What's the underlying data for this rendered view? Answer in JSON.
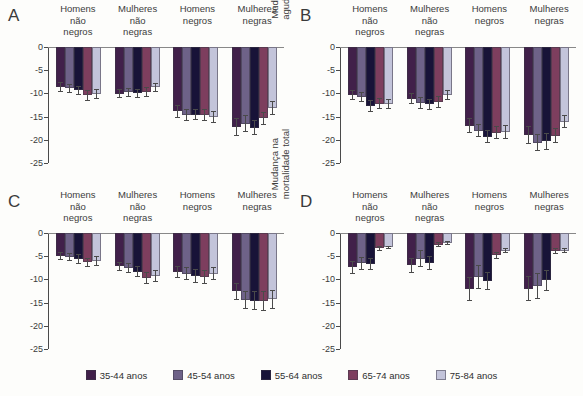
{
  "figure": {
    "background": "#fdfdfb",
    "groups": [
      {
        "lines": [
          "Homens",
          "não",
          "negros"
        ]
      },
      {
        "lines": [
          "Mulheres",
          "não",
          "negras"
        ]
      },
      {
        "lines": [
          "Homens",
          "negros"
        ]
      },
      {
        "lines": [
          "Mulheres",
          "negras"
        ]
      }
    ],
    "y_ticks": [
      "0",
      "-5",
      "-10",
      "-15",
      "-20",
      "-25"
    ]
  },
  "legend": {
    "position": "bottom-center",
    "items": [
      {
        "label": "35-44 anos",
        "color": "#41204a"
      },
      {
        "label": "45-54 anos",
        "color": "#6e6288"
      },
      {
        "label": "55-64 anos",
        "color": "#181338"
      },
      {
        "label": "65-74 anos",
        "color": "#7d3e5e"
      },
      {
        "label": "75-84 anos",
        "color": "#c3c4da"
      }
    ]
  },
  "chart_data": [
    {
      "panel": "A",
      "type": "bar",
      "title": "",
      "ylabel": "Mudança na incidência de\ndoença coronariana",
      "xlabel": "",
      "ylim": [
        -25,
        0
      ],
      "grid": false,
      "categories": [
        "Homens não negros",
        "Mulheres não negras",
        "Homens negros",
        "Mulheres negras"
      ],
      "series": [
        {
          "name": "35-44 anos",
          "color": "#41204a",
          "values": [
            -8.6,
            -10.1,
            -13.9,
            -17.2
          ],
          "errors": [
            1.1,
            1.0,
            1.5,
            1.9
          ]
        },
        {
          "name": "45-54 anos",
          "color": "#6e6288",
          "values": [
            -8.9,
            -9.8,
            -14.7,
            -16.5
          ],
          "errors": [
            1.0,
            0.9,
            1.3,
            1.8
          ]
        },
        {
          "name": "55-64 anos",
          "color": "#181338",
          "values": [
            -9.3,
            -10.0,
            -14.6,
            -17.4
          ],
          "errors": [
            1.0,
            0.9,
            1.2,
            1.6
          ]
        },
        {
          "name": "65-74 anos",
          "color": "#7d3e5e",
          "values": [
            -10.4,
            -9.7,
            -14.6,
            -15.4
          ],
          "errors": [
            1.2,
            1.1,
            1.3,
            1.4
          ]
        },
        {
          "name": "75-84 anos",
          "color": "#c3c4da",
          "values": [
            -10.2,
            -8.7,
            -15.1,
            -13.1
          ],
          "errors": [
            1.1,
            1.0,
            1.2,
            1.5
          ]
        }
      ]
    },
    {
      "panel": "B",
      "type": "bar",
      "title": "",
      "ylabel": "Mudança no infarto\nagudo do miocárdio",
      "xlabel": "",
      "ylim": [
        -25,
        0
      ],
      "grid": false,
      "categories": [
        "Homens não negros",
        "Mulheres não negras",
        "Homens negros",
        "Mulheres negras"
      ],
      "series": [
        {
          "name": "35-44 anos",
          "color": "#41204a",
          "values": [
            -10.4,
            -11.1,
            -17.0,
            -19.0
          ],
          "errors": [
            1.1,
            1.2,
            1.6,
            1.9
          ]
        },
        {
          "name": "45-54 anos",
          "color": "#6e6288",
          "values": [
            -10.8,
            -12.0,
            -18.0,
            -20.6
          ],
          "errors": [
            1.0,
            1.3,
            1.4,
            1.9
          ]
        },
        {
          "name": "55-64 anos",
          "color": "#181338",
          "values": [
            -12.8,
            -12.3,
            -19.3,
            -20.3
          ],
          "errors": [
            1.3,
            1.2,
            1.5,
            1.8
          ]
        },
        {
          "name": "65-74 anos",
          "color": "#7d3e5e",
          "values": [
            -12.2,
            -11.8,
            -18.5,
            -19.1
          ],
          "errors": [
            1.2,
            1.3,
            1.4,
            1.6
          ]
        },
        {
          "name": "75-84 anos",
          "color": "#c3c4da",
          "values": [
            -12.2,
            -10.3,
            -18.4,
            -16.1
          ],
          "errors": [
            1.1,
            1.1,
            1.5,
            1.4
          ]
        }
      ]
    },
    {
      "panel": "C",
      "type": "bar",
      "title": "",
      "ylabel": "Mudança na incidência de\nacidente vascular encefálico",
      "xlabel": "",
      "ylim": [
        -25,
        0
      ],
      "grid": false,
      "categories": [
        "Homens não negros",
        "Mulheres não negras",
        "Homens negros",
        "Mulheres negras"
      ],
      "series": [
        {
          "name": "35-44 anos",
          "color": "#41204a",
          "values": [
            -5.0,
            -7.2,
            -8.5,
            -12.6
          ],
          "errors": [
            0.9,
            1.0,
            1.3,
            1.8
          ]
        },
        {
          "name": "45-54 anos",
          "color": "#6e6288",
          "values": [
            -5.2,
            -7.5,
            -8.8,
            -14.4
          ],
          "errors": [
            0.8,
            1.1,
            1.4,
            1.9
          ]
        },
        {
          "name": "55-64 anos",
          "color": "#181338",
          "values": [
            -5.6,
            -8.3,
            -9.3,
            -14.6
          ],
          "errors": [
            1.0,
            1.1,
            1.5,
            2.0
          ]
        },
        {
          "name": "65-74 anos",
          "color": "#7d3e5e",
          "values": [
            -6.3,
            -9.6,
            -9.4,
            -14.7
          ],
          "errors": [
            1.0,
            1.3,
            1.5,
            2.1
          ]
        },
        {
          "name": "75-84 anos",
          "color": "#c3c4da",
          "values": [
            -6.0,
            -9.2,
            -8.8,
            -14.3
          ],
          "errors": [
            1.1,
            1.3,
            1.4,
            2.1
          ]
        }
      ]
    },
    {
      "panel": "D",
      "type": "bar",
      "title": "",
      "ylabel": "Mudança na\nmortalidade total",
      "xlabel": "",
      "ylim": [
        -25,
        0
      ],
      "grid": false,
      "categories": [
        "Homens não negros",
        "Mulheres não negras",
        "Homens negros",
        "Mulheres negras"
      ],
      "series": [
        {
          "name": "35-44 anos",
          "color": "#41204a",
          "values": [
            -7.4,
            -7.0,
            -12.1,
            -12.0
          ],
          "errors": [
            1.4,
            1.6,
            2.6,
            2.7
          ]
        },
        {
          "name": "45-54 anos",
          "color": "#6e6288",
          "values": [
            -6.5,
            -5.5,
            -9.5,
            -11.4
          ],
          "errors": [
            1.4,
            1.9,
            2.5,
            2.8
          ]
        },
        {
          "name": "55-64 anos",
          "color": "#181338",
          "values": [
            -6.6,
            -6.4,
            -10.3,
            -10.2
          ],
          "errors": [
            1.3,
            1.5,
            1.9,
            2.2
          ]
        },
        {
          "name": "65-74 anos",
          "color": "#7d3e5e",
          "values": [
            -3.3,
            -2.5,
            -4.8,
            -3.9
          ],
          "errors": [
            0.5,
            0.5,
            0.7,
            0.6
          ]
        },
        {
          "name": "75-84 anos",
          "color": "#c3c4da",
          "values": [
            -3.1,
            -2.2,
            -3.8,
            -3.8
          ],
          "errors": [
            0.4,
            0.4,
            0.6,
            0.6
          ]
        }
      ]
    }
  ]
}
